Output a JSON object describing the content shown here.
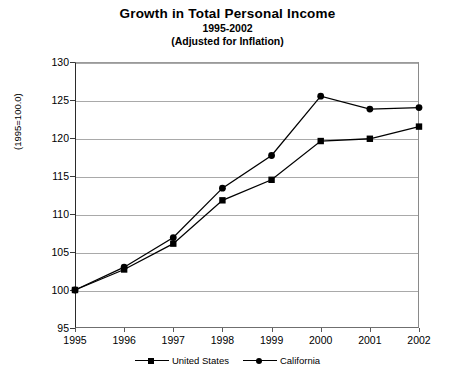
{
  "chart_data": {
    "type": "line",
    "title": "Growth in Total Personal Income",
    "subtitle": "1995-2002",
    "subtitle2": "(Adjusted for Inflation)",
    "xlabel": "",
    "ylabel": "(1995=100.0)",
    "x": [
      1995,
      1996,
      1997,
      1998,
      1999,
      2000,
      2001,
      2002
    ],
    "categories": [
      "1995",
      "1996",
      "1997",
      "1998",
      "1999",
      "2000",
      "2001",
      "2002"
    ],
    "ylim": [
      95,
      130
    ],
    "yticks": [
      95,
      100,
      105,
      110,
      115,
      120,
      125,
      130
    ],
    "ytick_labels": [
      "95",
      "100",
      "105",
      "110",
      "115",
      "120",
      "125",
      "130"
    ],
    "grid": true,
    "legend_position": "bottom",
    "series": [
      {
        "name": "United States",
        "marker": "square",
        "color": "#000000",
        "values": [
          100.0,
          102.7,
          106.1,
          111.8,
          114.5,
          119.6,
          119.9,
          121.5
        ]
      },
      {
        "name": "California",
        "marker": "circle",
        "color": "#000000",
        "values": [
          100.0,
          103.0,
          106.9,
          113.4,
          117.7,
          125.5,
          123.8,
          124.0
        ]
      }
    ]
  },
  "legend": {
    "entries": [
      {
        "label": "United States",
        "marker": "square"
      },
      {
        "label": "California",
        "marker": "circle"
      }
    ]
  }
}
